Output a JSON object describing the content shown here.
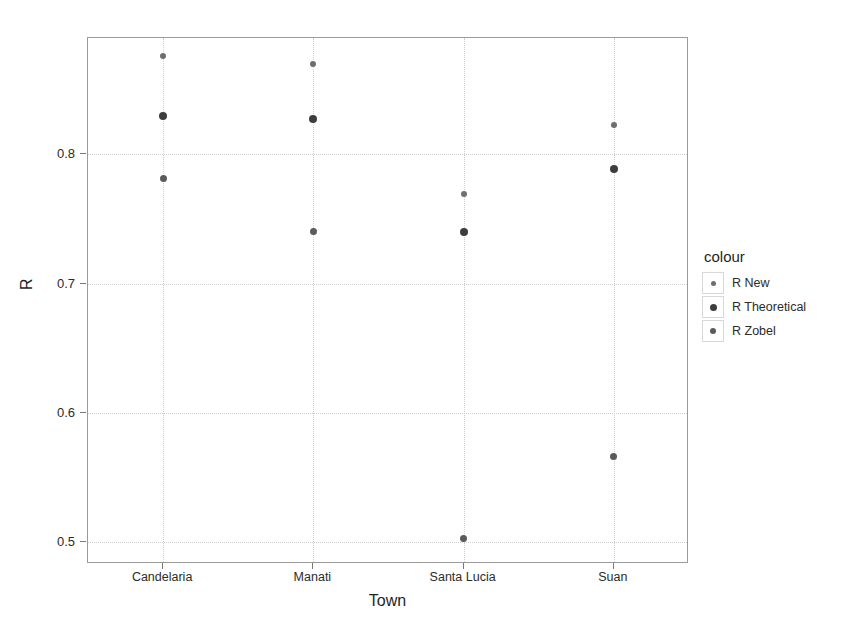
{
  "chart_data": {
    "type": "scatter",
    "title": "",
    "xlabel": "Town",
    "ylabel": "R",
    "categories": [
      "Candelaria",
      "Manati",
      "Santa Lucia",
      "Suan"
    ],
    "ylim": [
      0.483,
      0.89
    ],
    "yticks": [
      0.5,
      0.6,
      0.7,
      0.8
    ],
    "ytick_labels": [
      "0.5",
      "0.6",
      "0.7",
      "0.8"
    ],
    "grid": true,
    "legend": {
      "title": "colour",
      "position": "right",
      "entries": [
        "R New",
        "R Theoretical",
        "R Zobel"
      ]
    },
    "series": [
      {
        "name": "R New",
        "color": "#6e6e6e",
        "values": [
          0.876,
          0.87,
          0.769,
          0.823
        ]
      },
      {
        "name": "R Theoretical",
        "color": "#3d3d3d",
        "values": [
          0.83,
          0.827,
          0.74,
          0.789
        ]
      },
      {
        "name": "R Zobel",
        "color": "#5a5a5a",
        "values": [
          0.781,
          0.74,
          0.503,
          0.566
        ]
      }
    ]
  }
}
